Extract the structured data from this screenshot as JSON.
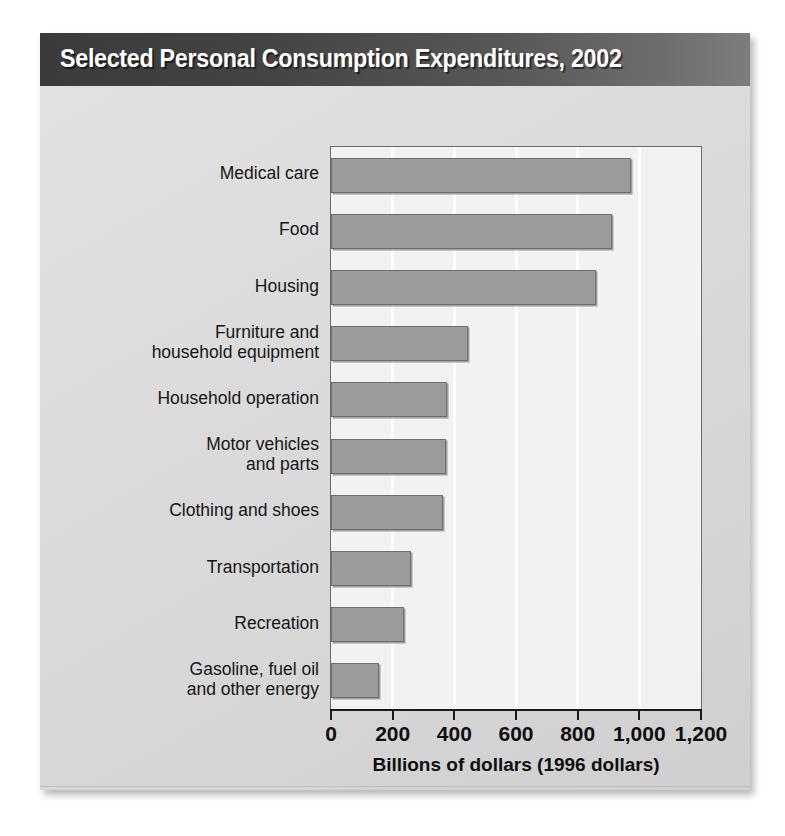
{
  "card": {
    "title": "Selected Personal Consumption Expenditures, 2002",
    "source_note": "Source: Bureau of Economic Analysis"
  },
  "colors": {
    "header_dark": "#3b3b3b",
    "header_light": "#7d7d7d",
    "card_background": "#dcdcdc",
    "plot_background": "#f2f2f2",
    "bar_fill": "#9b9b9b",
    "bar_border": "#6f6f6f",
    "gridline": "#fdfdfd",
    "axis": "#1a1a1a",
    "text": "#161616"
  },
  "chart_data": {
    "type": "bar",
    "orientation": "horizontal",
    "title": "Selected Personal Consumption Expenditures, 2002",
    "subtitle": "",
    "xlabel": "Billions of dollars (1996 dollars)",
    "ylabel": "",
    "xlim": [
      0,
      1200
    ],
    "xticks": [
      0,
      200,
      400,
      600,
      800,
      1000,
      1200
    ],
    "xtick_labels": [
      "0",
      "200",
      "400",
      "600",
      "800",
      "1,000",
      "1,200"
    ],
    "grid": "vertical",
    "legend": "none",
    "categories": [
      "Medical care",
      "Food",
      "Housing",
      "Furniture and\nhousehold equipment",
      "Household operation",
      "Motor vehicles\nand parts",
      "Clothing and shoes",
      "Transportation",
      "Recreation",
      "Gasoline, fuel oil\nand other energy"
    ],
    "values": [
      973,
      911,
      860,
      444,
      376,
      373,
      363,
      260,
      237,
      156
    ],
    "units": "billions of 1996 dollars",
    "source": "Bureau of Economic Analysis"
  }
}
